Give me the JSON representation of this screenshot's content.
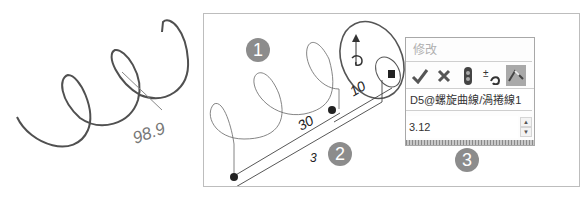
{
  "left_figure": {
    "angle_label": "98.9"
  },
  "sketch": {
    "badge_1": "1",
    "badge_2": "2",
    "badge_3": "3",
    "dim_30": "30",
    "dim_10": "10",
    "dim_3": "3"
  },
  "modify_panel": {
    "title": "修改",
    "toolbar": [
      {
        "icon": "check-icon",
        "symbol": "✔"
      },
      {
        "icon": "close-icon",
        "symbol": "✖"
      },
      {
        "icon": "rebuild-icon",
        "symbol": ""
      },
      {
        "icon": "reset-value-icon",
        "symbol": "±"
      },
      {
        "icon": "mark-dimension-icon",
        "symbol": ""
      }
    ],
    "dimension_name": "D5@螺旋曲線/渦捲線1",
    "value": "3.12"
  },
  "colors": {
    "curve": "#505050",
    "badge": "#8c8c8c",
    "active_button": "#a9a9a9"
  }
}
